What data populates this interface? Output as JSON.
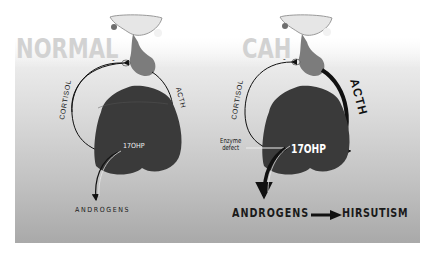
{
  "panels": {
    "normal": {
      "title": "NORMAL",
      "minus_sign": "-",
      "cortisol_label": "CORTISOL",
      "acth_label": "ACTH",
      "precursor_label": "17OHP",
      "output_label": "ANDROGENS"
    },
    "cah": {
      "title": "CAH",
      "minus_sign": "-",
      "cortisol_label": "CORTISOL",
      "acth_label": "ACTH",
      "precursor_label": "17OHP",
      "defect_label_line1": "Enzyme",
      "defect_label_line2": "defect",
      "output_label": "ANDROGENS",
      "result_label": "HIRSUTISM"
    }
  },
  "colors": {
    "panel_top": "#f4f4f4",
    "panel_bottom": "#a9a9a9",
    "title_text": "#d2d2d2",
    "gland": "#3a3a3a",
    "pituitary": "#7a7a7a",
    "arrow": "#111111"
  }
}
